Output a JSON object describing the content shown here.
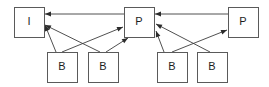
{
  "diagram": {
    "type": "node-link-diagram",
    "background_color": "#ffffff",
    "box_fill_color": "#ffffff",
    "box_stroke_color": "#5a5a5a",
    "edge_color": "#3c3c3c",
    "label_color": "#1d1d1d",
    "canvas": {
      "width": 269,
      "height": 87
    },
    "nodes": [
      {
        "id": "I1",
        "label": "I",
        "row": "top",
        "x": 14,
        "y": 7,
        "w": 30,
        "h": 30
      },
      {
        "id": "P1",
        "label": "P",
        "row": "top",
        "x": 124,
        "y": 7,
        "w": 30,
        "h": 30
      },
      {
        "id": "P2",
        "label": "P",
        "row": "top",
        "x": 228,
        "y": 7,
        "w": 30,
        "h": 30
      },
      {
        "id": "B1",
        "label": "B",
        "row": "bottom",
        "x": 47,
        "y": 52,
        "w": 30,
        "h": 30
      },
      {
        "id": "B2",
        "label": "B",
        "row": "bottom",
        "x": 88,
        "y": 52,
        "w": 30,
        "h": 30
      },
      {
        "id": "B3",
        "label": "B",
        "row": "bottom",
        "x": 157,
        "y": 52,
        "w": 30,
        "h": 30
      },
      {
        "id": "B4",
        "label": "B",
        "row": "bottom",
        "x": 197,
        "y": 52,
        "w": 30,
        "h": 30
      }
    ],
    "edges": [
      {
        "id": "e1",
        "from": "P1",
        "to": "I1",
        "kind": "horizontal",
        "x1": 124,
        "y1": 14,
        "x2": 45,
        "y2": 14
      },
      {
        "id": "e2",
        "from": "P2",
        "to": "P1",
        "kind": "horizontal",
        "x1": 228,
        "y1": 14,
        "x2": 155,
        "y2": 14
      },
      {
        "id": "e3",
        "from": "B1",
        "to": "P1",
        "kind": "diagonal",
        "x1": 62,
        "y1": 52,
        "x2": 123,
        "y2": 27
      },
      {
        "id": "e4",
        "from": "B2",
        "to": "I1",
        "kind": "diagonal",
        "x1": 100,
        "y1": 52,
        "x2": 45,
        "y2": 25
      },
      {
        "id": "e5",
        "from": "B2",
        "to": "P1",
        "kind": "diagonal",
        "x1": 106,
        "y1": 52,
        "x2": 128,
        "y2": 38
      },
      {
        "id": "e6",
        "from": "B1",
        "to": "I1",
        "kind": "diagonal",
        "x1": 56,
        "y1": 52,
        "x2": 45,
        "y2": 25
      },
      {
        "id": "e7",
        "from": "B3",
        "to": "P2",
        "kind": "diagonal",
        "x1": 172,
        "y1": 52,
        "x2": 227,
        "y2": 30
      },
      {
        "id": "e8",
        "from": "B4",
        "to": "P1",
        "kind": "diagonal",
        "x1": 210,
        "y1": 52,
        "x2": 156,
        "y2": 24
      },
      {
        "id": "e9",
        "from": "B3",
        "to": "P1",
        "kind": "diagonal",
        "x1": 164,
        "y1": 52,
        "x2": 156,
        "y2": 31
      }
    ],
    "labels": {
      "I": "I",
      "P": "P",
      "B": "B"
    }
  }
}
